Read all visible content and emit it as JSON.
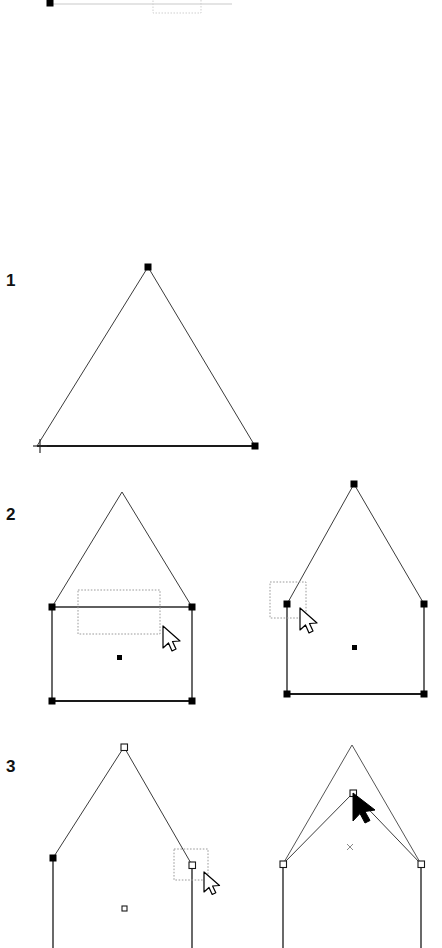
{
  "figure": {
    "background_color": "#ffffff",
    "ink_color": "#1a1a1a",
    "marquee_color": "#9a9a9a",
    "width": 442,
    "height": 948
  },
  "steps": [
    {
      "id": "step-1",
      "label": "1",
      "x": 6,
      "y": 272,
      "caption": "Triangle drawn with crosshair tool, baseline selected"
    },
    {
      "id": "step-2",
      "label": "2",
      "x": 6,
      "y": 506,
      "caption": "House outline, marquee selecting nodes, baseline removed"
    },
    {
      "id": "step-3",
      "label": "3",
      "x": 6,
      "y": 758,
      "caption": "Shoulder node selected, apex node dragged down"
    }
  ],
  "panels": [
    {
      "id": "panel-1",
      "step": "1",
      "shape": "triangle",
      "vertices": [
        [
          148,
          267
        ],
        [
          37,
          446
        ],
        [
          255,
          446
        ]
      ],
      "bold_edges": [
        [
          [
            37,
            446
          ],
          [
            255,
            446
          ]
        ]
      ],
      "handles": [
        {
          "x": 148,
          "y": 267,
          "style": "solid"
        },
        {
          "x": 255,
          "y": 446,
          "style": "solid"
        }
      ],
      "cursor": {
        "type": "crosshair-icon",
        "x": 40,
        "y": 446
      },
      "marquees": []
    },
    {
      "id": "panel-2-left",
      "step": "2",
      "shape": "house-with-divider",
      "apex": [
        122,
        492
      ],
      "shoulders": [
        [
          52,
          607
        ],
        [
          192,
          607
        ]
      ],
      "base": [
        [
          52,
          701
        ],
        [
          192,
          701
        ]
      ],
      "divider_line": [
        [
          52,
          607
        ],
        [
          192,
          607
        ]
      ],
      "handles": [
        {
          "x": 52,
          "y": 607,
          "style": "solid"
        },
        {
          "x": 192,
          "y": 607,
          "style": "solid"
        },
        {
          "x": 52,
          "y": 701,
          "style": "solid"
        },
        {
          "x": 192,
          "y": 701,
          "style": "solid"
        }
      ],
      "center_dot": {
        "x": 120,
        "y": 658,
        "style": "solid"
      },
      "marquees": [
        {
          "x": 78,
          "y": 590,
          "w": 82,
          "h": 44
        }
      ],
      "cursor": {
        "type": "arrow-cursor-outline",
        "x": 166,
        "y": 630
      }
    },
    {
      "id": "panel-2-right",
      "step": "2",
      "shape": "house-no-divider",
      "apex": [
        354,
        484
      ],
      "shoulders": [
        [
          287,
          604
        ],
        [
          424,
          604
        ]
      ],
      "base": [
        [
          287,
          694
        ],
        [
          424,
          694
        ]
      ],
      "divider_line": null,
      "handles": [
        {
          "x": 354,
          "y": 484,
          "style": "solid"
        },
        {
          "x": 287,
          "y": 604,
          "style": "solid"
        },
        {
          "x": 424,
          "y": 604,
          "style": "solid"
        },
        {
          "x": 287,
          "y": 694,
          "style": "solid"
        },
        {
          "x": 424,
          "y": 694,
          "style": "solid"
        }
      ],
      "center_dot": {
        "x": 355,
        "y": 648,
        "style": "solid"
      },
      "marquees": [
        {
          "x": 270,
          "y": 582,
          "w": 36,
          "h": 36
        }
      ],
      "cursor": {
        "type": "arrow-cursor-outline",
        "x": 303,
        "y": 612
      }
    },
    {
      "id": "panel-3-left",
      "step": "3",
      "shape": "house-open-bottom",
      "apex": [
        124,
        747
      ],
      "shoulders": [
        [
          53,
          858
        ],
        [
          192,
          865
        ]
      ],
      "walls_bottom_y": 948,
      "handles": [
        {
          "x": 124,
          "y": 747,
          "style": "hollow"
        },
        {
          "x": 53,
          "y": 858,
          "style": "solid"
        },
        {
          "x": 192,
          "y": 865,
          "style": "hollow"
        }
      ],
      "center_dot": {
        "x": 124,
        "y": 909,
        "style": "hollow"
      },
      "marquees": [
        {
          "x": 174,
          "y": 849,
          "w": 34,
          "h": 31
        }
      ],
      "cursor": {
        "type": "arrow-cursor-outline",
        "x": 207,
        "y": 876
      }
    },
    {
      "id": "panel-3-right",
      "step": "3",
      "shape": "house-apex-dragged",
      "original_apex": [
        352,
        745
      ],
      "dragged_apex": [
        353,
        793
      ],
      "shoulders": [
        [
          283,
          864
        ],
        [
          421,
          864
        ]
      ],
      "walls_bottom_y": 948,
      "handles": [
        {
          "x": 353,
          "y": 793,
          "style": "hollow"
        },
        {
          "x": 283,
          "y": 864,
          "style": "hollow"
        },
        {
          "x": 421,
          "y": 864,
          "style": "hollow"
        }
      ],
      "center_mark": {
        "x": 350,
        "y": 847,
        "style": "x-mark"
      },
      "marquees": [],
      "cursor": {
        "type": "arrow-cursor-filled",
        "x": 355,
        "y": 795
      }
    }
  ],
  "top_fragment": {
    "id": "clipped-figure-above",
    "description": "Partially clipped bottom edge of the preceding figure",
    "baseline": {
      "x1": 47,
      "y1": 4,
      "x2": 232,
      "y2": 4
    },
    "handle": {
      "x": 50,
      "y": 3
    },
    "marquee": {
      "x": 153,
      "y": 0,
      "w": 48,
      "h": 13
    }
  }
}
